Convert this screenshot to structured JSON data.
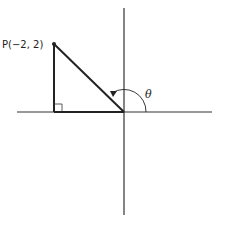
{
  "diagram": {
    "type": "coordinate-angle-diagram",
    "point_label": "P(−2, 2)",
    "point": {
      "x": -2,
      "y": 2
    },
    "angle_label": "θ",
    "right_angle_marker": true,
    "colors": {
      "line": "#222222",
      "axis": "#333333",
      "background": "#ffffff"
    }
  }
}
